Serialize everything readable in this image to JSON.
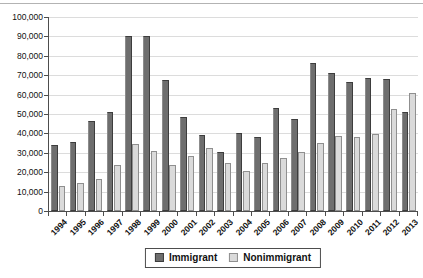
{
  "chart_data": {
    "type": "bar",
    "title": "",
    "xlabel": "",
    "ylabel": "",
    "categories": [
      "1994",
      "1995",
      "1996",
      "1997",
      "1998",
      "1999",
      "2000",
      "2001",
      "2002",
      "2003",
      "2004",
      "2005",
      "2006",
      "2007",
      "2008",
      "2009",
      "2010",
      "2011",
      "2012",
      "2013"
    ],
    "series": [
      {
        "name": "Immigrant",
        "color": "#6e6e6e",
        "border_color": "#3d3d3d",
        "values": [
          34000,
          35500,
          46500,
          51000,
          90000,
          90000,
          67500,
          48500,
          39000,
          30500,
          40000,
          38000,
          53000,
          47500,
          76500,
          71000,
          66500,
          68500,
          68000,
          51000
        ]
      },
      {
        "name": "Nonimmigrant",
        "color": "#dadada",
        "border_color": "#8f8f8f",
        "values": [
          13000,
          14500,
          16500,
          23500,
          34500,
          31000,
          23500,
          28500,
          32500,
          24500,
          20500,
          25000,
          27500,
          30500,
          35000,
          38500,
          38000,
          39500,
          52500,
          61000
        ]
      }
    ],
    "ylim": [
      0,
      100000
    ],
    "ytick_step": 10000,
    "ytick_labels": [
      "0",
      "10,000",
      "20,000",
      "30,000",
      "40,000",
      "50,000",
      "60,000",
      "70,000",
      "80,000",
      "90,000",
      "100,000"
    ],
    "grid": true,
    "legend_position": "bottom",
    "axis_color": "#4d4d4d",
    "gridline_color": "#dcdcdc"
  }
}
